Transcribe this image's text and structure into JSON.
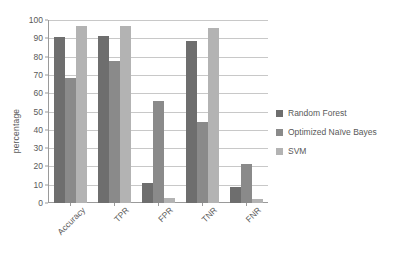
{
  "chart_data": {
    "type": "bar",
    "title": "",
    "xlabel": "",
    "ylabel": "percentage",
    "ylim": [
      0,
      100
    ],
    "ytick_step": 10,
    "yticks": [
      0,
      10,
      20,
      30,
      40,
      50,
      60,
      70,
      80,
      90,
      100
    ],
    "grid": true,
    "legend_position": "right",
    "categories": [
      "Accuracy",
      "TPR",
      "FPR",
      "TNR",
      "FNR"
    ],
    "series": [
      {
        "name": "Random Forest",
        "color": "#6e6e6e",
        "values": [
          90.5,
          91,
          11,
          88.5,
          8.5
        ]
      },
      {
        "name": "Optimized Naïve Bayes",
        "color": "#8a8a8a",
        "values": [
          68.5,
          77.5,
          55.5,
          44.5,
          21.5
        ]
      },
      {
        "name": "SVM",
        "color": "#b3b3b3",
        "values": [
          96.5,
          96.5,
          3,
          95.5,
          2
        ]
      }
    ]
  },
  "legend": {
    "items": [
      {
        "label": "Random Forest"
      },
      {
        "label": "Optimized Naïve Bayes"
      },
      {
        "label": "SVM"
      }
    ]
  }
}
